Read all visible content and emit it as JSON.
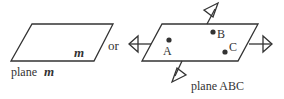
{
  "left": {
    "plane_letter": "m",
    "caption_prefix": "plane ",
    "caption_letter": "m"
  },
  "connector": "or",
  "right": {
    "points": [
      {
        "label": "A"
      },
      {
        "label": "B"
      },
      {
        "label": "C"
      }
    ],
    "caption": "plane ABC"
  }
}
